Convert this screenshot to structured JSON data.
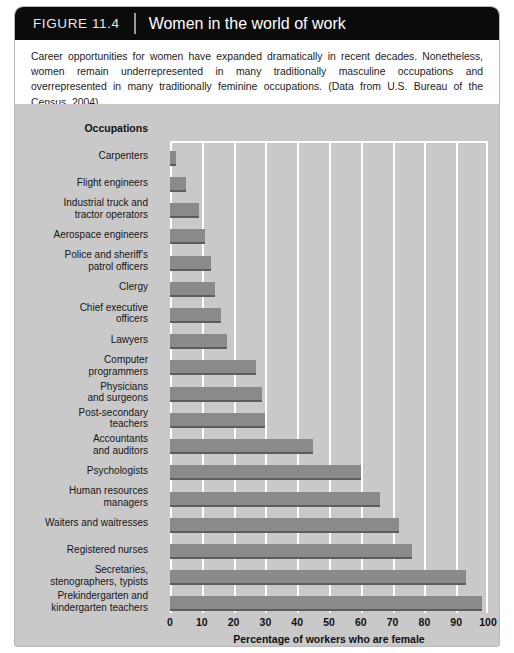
{
  "figure": {
    "number_label": "FIGURE 11.4",
    "title": "Women in the world of work",
    "caption": "Career opportunities for women have expanded dramatically in recent decades. Nonetheless, women remain underrepresented in many traditionally masculine occupations and overrepresented in many traditionally feminine occupations. (Data from U.S. Bureau of the Census, 2004)",
    "credit": "© Cengage Learning"
  },
  "chart": {
    "y_axis_header": "Occupations",
    "x_axis_title": "Percentage of workers who are female",
    "bar_color": "#8a8a8a",
    "bar_shadow_color": "#5d5d5d",
    "panel_color": "#c9c9c9",
    "gridline_color": "#ffffff"
  },
  "chart_data": {
    "type": "bar",
    "orientation": "horizontal",
    "title": "Women in the world of work",
    "xlabel": "Percentage of workers who are female",
    "ylabel": "Occupations",
    "xlim": [
      0,
      100
    ],
    "xticks": [
      0,
      10,
      20,
      30,
      40,
      50,
      60,
      70,
      80,
      90,
      100
    ],
    "grid": true,
    "legend": null,
    "categories": [
      "Carpenters",
      "Flight engineers",
      "Industrial truck and tractor operators",
      "Aerospace engineers",
      "Police and sheriff's patrol officers",
      "Clergy",
      "Chief executive officers",
      "Lawyers",
      "Computer programmers",
      "Physicians and surgeons",
      "Post-secondary teachers",
      "Accountants and auditors",
      "Psychologists",
      "Human resources managers",
      "Waiters and waitresses",
      "Registered nurses",
      "Secretaries, stenographers, typists",
      "Prekindergarten and kindergarten teachers"
    ],
    "category_lines": [
      [
        "Carpenters"
      ],
      [
        "Flight engineers"
      ],
      [
        "Industrial truck and",
        "tractor operators"
      ],
      [
        "Aerospace engineers"
      ],
      [
        "Police and sheriff's",
        "patrol officers"
      ],
      [
        "Clergy"
      ],
      [
        "Chief executive",
        "officers"
      ],
      [
        "Lawyers"
      ],
      [
        "Computer",
        "programmers"
      ],
      [
        "Physicians",
        "and surgeons"
      ],
      [
        "Post-secondary",
        "teachers"
      ],
      [
        "Accountants",
        "and auditors"
      ],
      [
        "Psychologists"
      ],
      [
        "Human resources",
        "managers"
      ],
      [
        "Waiters and waitresses"
      ],
      [
        "Registered nurses"
      ],
      [
        "Secretaries,",
        "stenographers, typists"
      ],
      [
        "Prekindergarten and",
        "kindergarten teachers"
      ]
    ],
    "values": [
      2,
      5,
      9,
      11,
      13,
      14,
      16,
      18,
      27,
      29,
      30,
      45,
      60,
      66,
      72,
      76,
      93,
      98
    ],
    "values_note": "Percentage of workers who are female"
  }
}
